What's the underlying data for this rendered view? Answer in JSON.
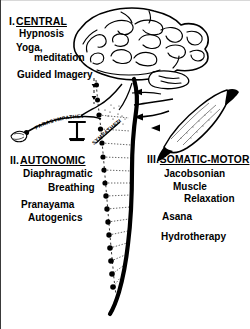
{
  "figure": {
    "background_color": "#ffffff",
    "ink_color": "#000000",
    "title_absent": true
  },
  "sections": [
    {
      "id": "central",
      "numeral": "I.",
      "heading": "CENTRAL",
      "heading_underlined": true,
      "items": [
        "Hypnosis",
        "Yoga,",
        "meditation",
        "Guided Imagery"
      ]
    },
    {
      "id": "autonomic",
      "numeral": "II.",
      "heading": "AUTONOMIC",
      "heading_underlined": true,
      "items": [
        "Diaphragmatic",
        "Breathing",
        "Pranayama",
        "Autogenics"
      ]
    },
    {
      "id": "somatic-motor",
      "numeral": "III.",
      "heading": "SOMATIC-MOTOR",
      "heading_underlined": true,
      "items": [
        "Jacobsonian",
        "Muscle",
        "Relaxation",
        "Asana",
        "Hydrotherapy"
      ]
    }
  ],
  "anatomy_labels": {
    "parasympathetic": "PARASYMPATHETIC",
    "sympathetic": "SYMPATHETIC"
  },
  "anatomy_parts": {
    "brain": "brain-illustration",
    "brainstem": "brainstem",
    "spinal_cord": "spinal-cord",
    "ganglion_chain": "sympathetic-ganglion-chain",
    "muscle": "skeletal-muscle",
    "motor_nerve": "motor-nerve",
    "target_organ": "parasympathetic-target-organ",
    "visceral_organ": "sympathetic-target-organ"
  }
}
